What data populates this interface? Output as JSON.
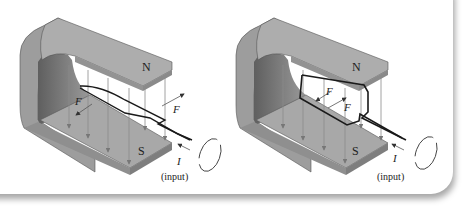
{
  "figures": [
    {
      "id": "left",
      "description": "Single straight wire loop segment in magnetic field between horseshoe magnet poles",
      "labels": {
        "north_pole": "N",
        "south_pole": "S",
        "force_1": "F",
        "force_2": "F",
        "current": "I",
        "input": "(input)"
      }
    },
    {
      "id": "right",
      "description": "Rectangular wire loop (coil) in magnetic field between horseshoe magnet poles",
      "labels": {
        "north_pole": "N",
        "south_pole": "S",
        "force_1": "F",
        "force_2": "F",
        "current": "I",
        "input": "(input)"
      }
    }
  ],
  "colors": {
    "magnet_top": "#a9a9a9",
    "magnet_side": "#8c8c8c",
    "magnet_inner": "#6e6e6e",
    "field_lines": "#8a8a8a",
    "wire": "#1a1a1a",
    "background": "#ffffff"
  }
}
